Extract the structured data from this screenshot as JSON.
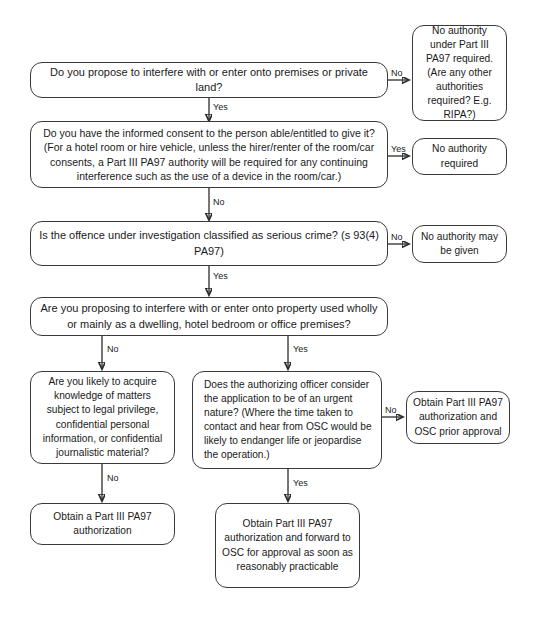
{
  "diagram": {
    "accent_color": "#3a3a3a",
    "background_color": "#ffffff",
    "nodes": [
      {
        "id": "q1",
        "text": "Do you propose to interfere with or enter onto premises or private land?"
      },
      {
        "id": "r1",
        "text": "No authority under Part III PA97 required. (Are any other authorities required? E.g. RIPA?)"
      },
      {
        "id": "q2",
        "text": "Do you have the informed consent to the person able/entitled to give it? (For a hotel room or hire vehicle, unless the hirer/renter of the room/car consents, a Part III PA97 authority will be required for any continuing interference such as the use of a device in the room/car.)"
      },
      {
        "id": "r2",
        "text": "No authority required"
      },
      {
        "id": "q3",
        "text": "Is the offence under investigation classified as serious crime? (s 93(4) PA97)"
      },
      {
        "id": "r3",
        "text": "No authority may be given"
      },
      {
        "id": "q4",
        "text": "Are you proposing to interfere with or enter onto property used wholly or mainly as a dwelling, hotel bedroom or office premises?"
      },
      {
        "id": "q5",
        "text": "Are you likely to acquire knowledge of matters subject to legal privilege, confidential personal information, or confidential journalistic material?"
      },
      {
        "id": "q6",
        "text": "Does the authorizing officer consider the application to be of an urgent nature? (Where the time taken to contact and hear from OSC would be likely to endanger life or jeopardise the operation.)"
      },
      {
        "id": "r4",
        "text": "Obtain Part III PA97 authorization and OSC prior approval"
      },
      {
        "id": "r5",
        "text": "Obtain a Part III PA97 authorization"
      },
      {
        "id": "r6",
        "text": "Obtain Part III PA97 authorization and forward to OSC for approval as soon as reasonably practicable"
      }
    ],
    "edges": [
      {
        "id": "e1",
        "from": "q1",
        "to": "r1",
        "label": "No"
      },
      {
        "id": "e2",
        "from": "q1",
        "to": "q2",
        "label": "Yes"
      },
      {
        "id": "e3",
        "from": "q2",
        "to": "r2",
        "label": "Yes"
      },
      {
        "id": "e4",
        "from": "q2",
        "to": "q3",
        "label": "No"
      },
      {
        "id": "e5",
        "from": "q3",
        "to": "r3",
        "label": "No"
      },
      {
        "id": "e6",
        "from": "q3",
        "to": "q4",
        "label": "Yes"
      },
      {
        "id": "e7",
        "from": "q4",
        "to": "q5",
        "label": "No"
      },
      {
        "id": "e8",
        "from": "q4",
        "to": "q6",
        "label": "Yes"
      },
      {
        "id": "e9",
        "from": "q6",
        "to": "r4",
        "label": "No"
      },
      {
        "id": "e10",
        "from": "q5",
        "to": "r5",
        "label": "No"
      },
      {
        "id": "e11",
        "from": "q6",
        "to": "r6",
        "label": "Yes"
      }
    ]
  }
}
